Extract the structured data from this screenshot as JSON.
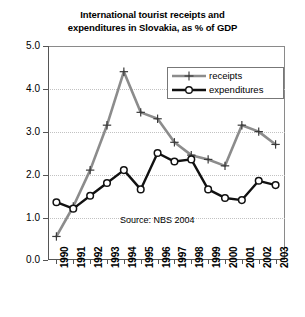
{
  "chart_data": {
    "type": "line",
    "title": "International tourist receipts and expenditures in Slovakia, as % of GDP",
    "title_line1": "International tourist receipts and",
    "title_line2": "expenditures in Slovakia, as % of GDP",
    "xlabel": "",
    "ylabel": "",
    "categories": [
      "1990",
      "1991",
      "1992",
      "1993",
      "1994",
      "1995",
      "1996",
      "1997",
      "1998",
      "1999",
      "2000",
      "2001",
      "2002",
      "2003"
    ],
    "ylim": [
      0.0,
      5.0
    ],
    "ytick_labels": [
      "0.0",
      "1.0",
      "2.0",
      "3.0",
      "4.0",
      "5.0"
    ],
    "ytick_values": [
      0.0,
      1.0,
      2.0,
      3.0,
      4.0,
      5.0
    ],
    "grid": true,
    "legend_position": "top-right",
    "annotation": "Source: NBS 2004",
    "series": [
      {
        "name": "receipts",
        "color": "#8c8c8c",
        "marker": "plus",
        "values": [
          0.55,
          1.25,
          2.1,
          3.15,
          4.4,
          3.45,
          3.3,
          2.75,
          2.45,
          2.35,
          2.2,
          3.15,
          3.0,
          2.7
        ]
      },
      {
        "name": "expenditures",
        "color": "#111111",
        "marker": "circle",
        "values": [
          1.35,
          1.2,
          1.5,
          1.8,
          2.1,
          1.65,
          2.5,
          2.3,
          2.35,
          1.65,
          1.45,
          1.4,
          1.85,
          1.75
        ]
      }
    ]
  },
  "legend": {
    "items": [
      {
        "label": "receipts"
      },
      {
        "label": "expenditures"
      }
    ]
  },
  "source": {
    "text": "Source: NBS 2004"
  }
}
